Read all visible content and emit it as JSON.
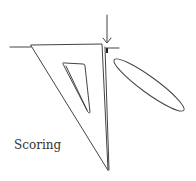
{
  "illustration": {
    "caption": "Scoring",
    "subject": "set-square with scoring blade",
    "stroke_color": "#444444",
    "background": "#ffffff"
  }
}
